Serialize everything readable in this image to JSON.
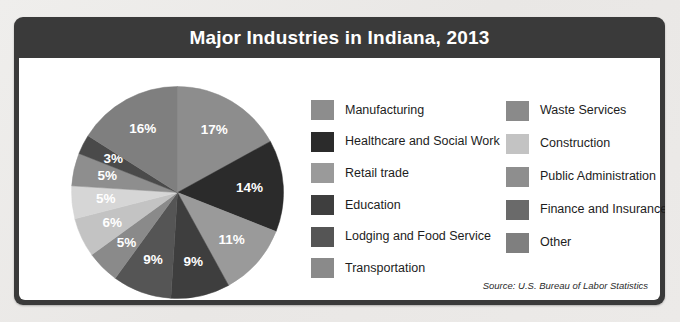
{
  "header": {
    "title": "Major Industries in Indiana, 2013"
  },
  "source": {
    "text": "Source: U.S. Bureau of Labor Statistics"
  },
  "legend": {
    "column1": [
      {
        "label": "Manufacturing",
        "color": "#8d8d8d"
      },
      {
        "label": "Healthcare and Social Work",
        "color": "#2b2b2b"
      },
      {
        "label": "Retail trade",
        "color": "#9a9a9a"
      },
      {
        "label": "Education",
        "color": "#3e3e3e"
      },
      {
        "label": "Lodging and Food Service",
        "color": "#555555"
      },
      {
        "label": "Transportation",
        "color": "#8a8a8a"
      }
    ],
    "column2": [
      {
        "label": "Waste Services",
        "color": "#8a8a8a"
      },
      {
        "label": "Construction",
        "color": "#c3c3c3"
      },
      {
        "label": "Public Administration",
        "color": "#8e8e8e"
      },
      {
        "label": "Finance and Insurance",
        "color": "#6a6a6a"
      },
      {
        "label": "Other",
        "color": "#7f7f7f"
      }
    ]
  },
  "chart_data": {
    "type": "pie",
    "title": "Major Industries in Indiana, 2013",
    "subtitle": "",
    "xlabel": "",
    "ylabel": "",
    "units": "percent",
    "legend_position": "right",
    "grid": false,
    "start_angle_deg": 0,
    "direction": "clockwise",
    "categories": [
      "Manufacturing",
      "Healthcare and Social Work",
      "Retail trade",
      "Education",
      "Lodging and Food Service",
      "Transportation",
      "Waste Services",
      "Construction",
      "Public Administration",
      "Finance and Insurance",
      "Other"
    ],
    "values": [
      17,
      14,
      11,
      9,
      9,
      5,
      6,
      5,
      5,
      3,
      16
    ],
    "data_labels": [
      "17%",
      "14%",
      "11%",
      "9%",
      "9%",
      "5%",
      "6%",
      "5%",
      "5%",
      "3%",
      "16%"
    ],
    "colors": [
      "#8d8d8d",
      "#2b2b2b",
      "#9a9a9a",
      "#3e3e3e",
      "#555555",
      "#8a8a8a",
      "#c3c3c3",
      "#d6d6d6",
      "#8e8e8e",
      "#4a4a4a",
      "#7f7f7f"
    ],
    "total": 100,
    "slices": [
      {
        "label": "Manufacturing",
        "value": 17,
        "data_label": "17%",
        "color": "#8d8d8d"
      },
      {
        "label": "Healthcare and Social Work",
        "value": 14,
        "data_label": "14%",
        "color": "#2b2b2b"
      },
      {
        "label": "Retail trade",
        "value": 11,
        "data_label": "11%",
        "color": "#9a9a9a"
      },
      {
        "label": "Education",
        "value": 9,
        "data_label": "9%",
        "color": "#3e3e3e"
      },
      {
        "label": "Lodging and Food Service",
        "value": 9,
        "data_label": "9%",
        "color": "#555555"
      },
      {
        "label": "Transportation",
        "value": 5,
        "data_label": "5%",
        "color": "#8a8a8a"
      },
      {
        "label": "Waste Services",
        "value": 6,
        "data_label": "6%",
        "color": "#c3c3c3"
      },
      {
        "label": "Construction",
        "value": 5,
        "data_label": "5%",
        "color": "#d6d6d6"
      },
      {
        "label": "Public Administration",
        "value": 5,
        "data_label": "5%",
        "color": "#8e8e8e"
      },
      {
        "label": "Finance and Insurance",
        "value": 3,
        "data_label": "3%",
        "color": "#4a4a4a"
      },
      {
        "label": "Other",
        "value": 16,
        "data_label": "16%",
        "color": "#7f7f7f"
      }
    ]
  }
}
